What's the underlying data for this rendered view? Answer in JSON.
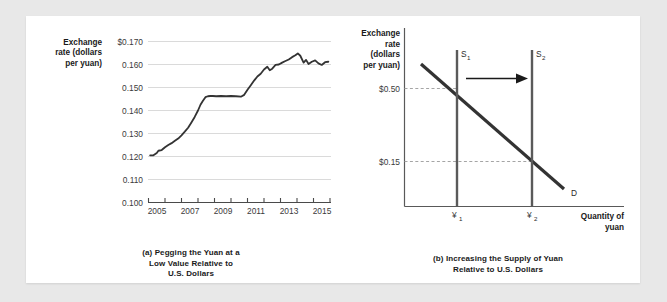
{
  "figure": {
    "background_color": "#e8e8e8",
    "card_color": "#ffffff"
  },
  "panel_a": {
    "caption_line1": "(a) Pegging the Yuan at a",
    "caption_line2": "Low Value Relative to",
    "caption_line3": "U.S. Dollars",
    "y_axis_title_line1": "Exchange",
    "y_axis_title_line2": "rate (dollars",
    "y_axis_title_line3": "per yuan)",
    "line_color": "#333333",
    "grid_color": "#d9d9d9"
  },
  "panel_b": {
    "caption_line1": "(b) Increasing the Supply of Yuan",
    "caption_line2": "Relative to U.S. Dollars",
    "y_axis_title_line1": "Exchange",
    "y_axis_title_line2": "rate",
    "y_axis_title_line3": "(dollars",
    "y_axis_title_line4": "per yuan)",
    "x_axis_title_line1": "Quantity of",
    "x_axis_title_line2": "yuan",
    "y_tick_high": "$0.50",
    "y_tick_low": "$0.15",
    "supply1_label": "S",
    "supply1_sub": "1",
    "supply2_label": "S",
    "supply2_sub": "2",
    "demand_label": "D",
    "q1_label": "¥",
    "q1_sub": "1",
    "q2_label": "¥",
    "q2_sub": "2",
    "supply_color": "#555555",
    "demand_color": "#333333",
    "axis_color": "#555555",
    "dashed_color": "#9a9a9a",
    "arrow_color": "#1a1a1a"
  },
  "chart_data": [
    {
      "type": "line",
      "title": "(a) Pegging the Yuan at a Low Value Relative to U.S. Dollars",
      "xlabel": "",
      "ylabel": "Exchange rate (dollars per yuan)",
      "xlim": [
        2005,
        2016
      ],
      "ylim": [
        0.1,
        0.17
      ],
      "grid": true,
      "legend": "none",
      "ytick_labels": [
        "$0.170",
        "0.160",
        "0.150",
        "0.140",
        "0.130",
        "0.120",
        "0.110",
        "0.100"
      ],
      "ytick_values": [
        0.17,
        0.16,
        0.15,
        0.14,
        0.13,
        0.12,
        0.11,
        0.1
      ],
      "xtick_labels": [
        "2005",
        "2007",
        "2009",
        "2011",
        "2013",
        "2015"
      ],
      "xtick_values": [
        2005,
        2007,
        2009,
        2011,
        2013,
        2015
      ],
      "xtick_minor_values": [
        2006,
        2008,
        2010,
        2012,
        2014,
        2016
      ],
      "x": [
        2005.1,
        2005.3,
        2005.5,
        2005.6,
        2005.8,
        2006.0,
        2006.2,
        2006.4,
        2006.6,
        2006.8,
        2007.0,
        2007.2,
        2007.4,
        2007.6,
        2007.8,
        2008.0,
        2008.15,
        2008.3,
        2008.45,
        2008.6,
        2008.75,
        2008.9,
        2009.1,
        2009.4,
        2009.7,
        2010.0,
        2010.3,
        2010.6,
        2010.8,
        2011.0,
        2011.2,
        2011.4,
        2011.6,
        2011.8,
        2012.0,
        2012.2,
        2012.35,
        2012.5,
        2012.7,
        2012.9,
        2013.1,
        2013.3,
        2013.5,
        2013.7,
        2013.9,
        2014.05,
        2014.2,
        2014.4,
        2014.55,
        2014.7,
        2014.9,
        2015.1,
        2015.3,
        2015.5,
        2015.7,
        2015.9
      ],
      "y": [
        0.1205,
        0.1205,
        0.1215,
        0.1225,
        0.1228,
        0.124,
        0.125,
        0.1258,
        0.1268,
        0.1278,
        0.1292,
        0.1308,
        0.1325,
        0.1348,
        0.1372,
        0.14,
        0.1425,
        0.1442,
        0.1458,
        0.1462,
        0.1463,
        0.1463,
        0.1462,
        0.1463,
        0.1462,
        0.1463,
        0.1462,
        0.146,
        0.1468,
        0.149,
        0.151,
        0.153,
        0.1548,
        0.156,
        0.1578,
        0.159,
        0.1575,
        0.1582,
        0.1598,
        0.16,
        0.1608,
        0.1615,
        0.1622,
        0.1632,
        0.164,
        0.1648,
        0.1638,
        0.1608,
        0.162,
        0.1602,
        0.1612,
        0.1618,
        0.1605,
        0.1598,
        0.161,
        0.1612
      ]
    },
    {
      "type": "line",
      "title": "(b) Increasing the Supply of Yuan Relative to U.S. Dollars",
      "xlabel": "Quantity of yuan",
      "ylabel": "Exchange rate (dollars per yuan)",
      "grid": false,
      "legend": "inline-labels",
      "annotations": [
        "S1",
        "S2",
        "D",
        "¥1",
        "¥2",
        "$0.50",
        "$0.15",
        "rightward-shift-arrow"
      ],
      "series": [
        {
          "name": "S1",
          "kind": "vertical-supply",
          "q": "¥1"
        },
        {
          "name": "S2",
          "kind": "vertical-supply",
          "q": "¥2"
        },
        {
          "name": "D",
          "kind": "downward-demand"
        }
      ],
      "equilibria": [
        {
          "label": "E1",
          "price": "$0.50",
          "quantity": "¥1"
        },
        {
          "label": "E2",
          "price": "$0.15",
          "quantity": "¥2"
        }
      ]
    }
  ]
}
